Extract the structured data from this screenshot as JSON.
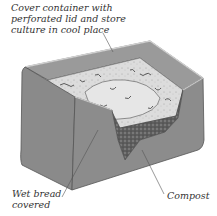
{
  "figure": {
    "labels": {
      "top": "Cover container with\nperforated lid and store\nculture in cool place",
      "wet_bread": "Wet bread\ncovered",
      "compost": "Compost"
    },
    "colors": {
      "container_front": "#8f8f8f",
      "container_side": "#7d7d7d",
      "container_inner": "#a0a0a0",
      "rim": "#c8c8c8",
      "bread": "#dedede",
      "mold": "#6a6a6a",
      "compost": "#5e5e5e",
      "leader_line": "#555555"
    }
  }
}
